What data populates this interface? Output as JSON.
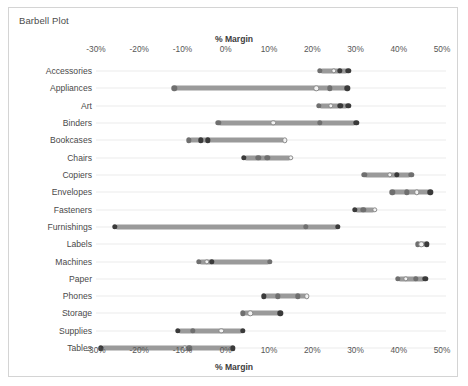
{
  "sheet": {
    "title": "Barbell Plot",
    "border_color": "#d4d4d4",
    "background": "#ffffff"
  },
  "chart_data": {
    "type": "scatter",
    "subtype": "barbell-dumbbell",
    "title": "Barbell Plot",
    "xlabel": "% Margin",
    "ylabel": "",
    "axis_title_top": "% Margin",
    "axis_title_bottom": "% Margin",
    "grid": true,
    "grid_orientation": "horizontal",
    "legend": "none",
    "xlim": [
      -30,
      50
    ],
    "xticks": [
      -30,
      -20,
      -10,
      0,
      10,
      20,
      30,
      40,
      50
    ],
    "xtick_labels": [
      "-30%",
      "-20%",
      "-10%",
      "0%",
      "10%",
      "20%",
      "30%",
      "40%",
      "50%"
    ],
    "categories": [
      "Accessories",
      "Appliances",
      "Art",
      "Binders",
      "Bookcases",
      "Chairs",
      "Copiers",
      "Envelopes",
      "Fasteners",
      "Furnishings",
      "Labels",
      "Machines",
      "Paper",
      "Phones",
      "Storage",
      "Supplies",
      "Tables"
    ],
    "marker_colors": {
      "dark": "#3a3a3a",
      "mid": "#6f6f6f",
      "light": "#f2f2f2"
    },
    "bar_color": "#9a9a9a",
    "rows": [
      {
        "category": "Accessories",
        "min": 21.8,
        "max": 28.3,
        "points": [
          {
            "value": 21.8,
            "shade": "mid"
          },
          {
            "value": 25.0,
            "shade": "light"
          },
          {
            "value": 26.4,
            "shade": "dark"
          },
          {
            "value": 28.3,
            "shade": "dark"
          }
        ]
      },
      {
        "category": "Appliances",
        "min": -11.9,
        "max": 28.1,
        "points": [
          {
            "value": -11.9,
            "shade": "mid"
          },
          {
            "value": 20.9,
            "shade": "light"
          },
          {
            "value": 24.1,
            "shade": "mid"
          },
          {
            "value": 28.1,
            "shade": "dark"
          }
        ]
      },
      {
        "category": "Art",
        "min": 21.5,
        "max": 28.3,
        "points": [
          {
            "value": 21.5,
            "shade": "mid"
          },
          {
            "value": 24.3,
            "shade": "light"
          },
          {
            "value": 26.5,
            "shade": "dark"
          },
          {
            "value": 28.3,
            "shade": "dark"
          }
        ]
      },
      {
        "category": "Binders",
        "min": -1.7,
        "max": 30.2,
        "points": [
          {
            "value": -1.7,
            "shade": "mid"
          },
          {
            "value": 11.0,
            "shade": "light"
          },
          {
            "value": 21.8,
            "shade": "mid"
          },
          {
            "value": 30.2,
            "shade": "dark"
          }
        ]
      },
      {
        "category": "Bookcases",
        "min": -8.5,
        "max": 13.7,
        "points": [
          {
            "value": -8.5,
            "shade": "mid"
          },
          {
            "value": -5.8,
            "shade": "dark"
          },
          {
            "value": -4.2,
            "shade": "dark"
          },
          {
            "value": 13.7,
            "shade": "light"
          }
        ]
      },
      {
        "category": "Chairs",
        "min": 4.2,
        "max": 15.1,
        "points": [
          {
            "value": 4.2,
            "shade": "dark"
          },
          {
            "value": 7.5,
            "shade": "mid"
          },
          {
            "value": 9.6,
            "shade": "mid"
          },
          {
            "value": 15.1,
            "shade": "light"
          }
        ]
      },
      {
        "category": "Copiers",
        "min": 32.0,
        "max": 42.9,
        "points": [
          {
            "value": 32.0,
            "shade": "mid"
          },
          {
            "value": 38.0,
            "shade": "light"
          },
          {
            "value": 39.6,
            "shade": "dark"
          },
          {
            "value": 42.9,
            "shade": "mid"
          }
        ]
      },
      {
        "category": "Envelopes",
        "min": 38.5,
        "max": 47.3,
        "points": [
          {
            "value": 38.5,
            "shade": "mid"
          },
          {
            "value": 41.8,
            "shade": "mid"
          },
          {
            "value": 44.2,
            "shade": "light"
          },
          {
            "value": 47.3,
            "shade": "dark"
          }
        ]
      },
      {
        "category": "Fasteners",
        "min": 29.9,
        "max": 34.5,
        "points": [
          {
            "value": 29.9,
            "shade": "dark"
          },
          {
            "value": 31.8,
            "shade": "mid"
          },
          {
            "value": 34.5,
            "shade": "light"
          }
        ]
      },
      {
        "category": "Furnishings",
        "min": -25.6,
        "max": 25.9,
        "points": [
          {
            "value": -25.6,
            "shade": "dark"
          },
          {
            "value": 18.5,
            "shade": "mid"
          },
          {
            "value": 25.9,
            "shade": "dark"
          }
        ]
      },
      {
        "category": "Labels",
        "min": 44.4,
        "max": 46.5,
        "points": [
          {
            "value": 44.4,
            "shade": "mid"
          },
          {
            "value": 45.2,
            "shade": "light"
          },
          {
            "value": 46.5,
            "shade": "dark"
          }
        ]
      },
      {
        "category": "Machines",
        "min": -6.2,
        "max": 10.2,
        "points": [
          {
            "value": -6.2,
            "shade": "mid"
          },
          {
            "value": -4.4,
            "shade": "light"
          },
          {
            "value": -3.2,
            "shade": "dark"
          },
          {
            "value": 10.2,
            "shade": "mid"
          }
        ]
      },
      {
        "category": "Paper",
        "min": 39.8,
        "max": 46.1,
        "points": [
          {
            "value": 39.8,
            "shade": "mid"
          },
          {
            "value": 41.7,
            "shade": "light"
          },
          {
            "value": 44.0,
            "shade": "mid"
          },
          {
            "value": 46.1,
            "shade": "dark"
          }
        ]
      },
      {
        "category": "Phones",
        "min": 8.8,
        "max": 18.8,
        "points": [
          {
            "value": 8.8,
            "shade": "dark"
          },
          {
            "value": 12.1,
            "shade": "mid"
          },
          {
            "value": 16.6,
            "shade": "mid"
          },
          {
            "value": 18.8,
            "shade": "light"
          }
        ]
      },
      {
        "category": "Storage",
        "min": 4.0,
        "max": 12.6,
        "points": [
          {
            "value": 4.0,
            "shade": "mid"
          },
          {
            "value": 5.7,
            "shade": "light"
          },
          {
            "value": 12.6,
            "shade": "dark"
          }
        ]
      },
      {
        "category": "Supplies",
        "min": -11.1,
        "max": 4.0,
        "points": [
          {
            "value": -11.1,
            "shade": "dark"
          },
          {
            "value": -7.6,
            "shade": "mid"
          },
          {
            "value": -1.0,
            "shade": "light"
          },
          {
            "value": 4.0,
            "shade": "dark"
          }
        ]
      },
      {
        "category": "Tables",
        "min": -28.9,
        "max": 1.6,
        "points": [
          {
            "value": -28.9,
            "shade": "dark"
          },
          {
            "value": -9.4,
            "shade": "light"
          },
          {
            "value": -8.4,
            "shade": "mid"
          },
          {
            "value": 1.6,
            "shade": "dark"
          }
        ]
      }
    ]
  }
}
